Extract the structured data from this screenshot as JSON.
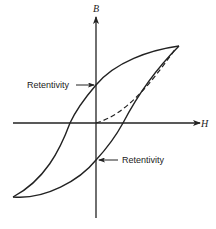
{
  "diagram": {
    "axes": {
      "x_label": "H",
      "y_label": "B"
    },
    "annotations": [
      {
        "label": "Retentivity",
        "position": "upper",
        "points_to": "positive B-axis intercept"
      },
      {
        "label": "Retentivity",
        "position": "lower",
        "points_to": "negative B-axis intercept"
      }
    ],
    "curves": [
      {
        "name": "hysteresis-loop",
        "style": "solid"
      },
      {
        "name": "initial-magnetization-curve",
        "style": "dashed"
      }
    ],
    "colors": {
      "line": "#222222",
      "background": "#ffffff"
    }
  }
}
